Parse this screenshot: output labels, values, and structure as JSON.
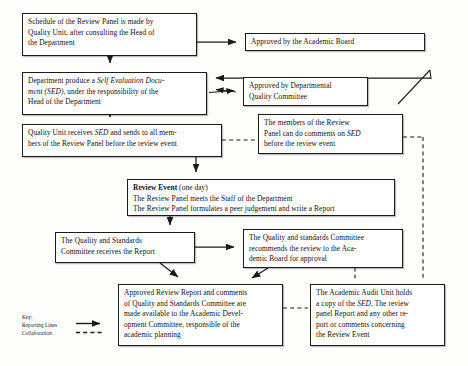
{
  "diagram": {
    "nodes": {
      "schedule": {
        "l1": "Schedule of the Review Panel is made by",
        "l2": "Quality Unit, after consulting the Head of",
        "l3": "the Department"
      },
      "academic_board": {
        "l1": "Approved by the Academic Board"
      },
      "department": {
        "l1a": "Department produce a ",
        "l1b": "Self Evaluation Docu-",
        "l2a": "ment (SED)",
        "l2b": ", under the responsibility of the",
        "l3": "Head of the Department"
      },
      "dept_quality_committee": {
        "l1": "Approved by Departmental",
        "l2": "Quality Committee"
      },
      "review_members": {
        "l1": "The members of the Review",
        "l2a": "Panel can do comments on ",
        "l2b": "SED",
        "l3": "before the review event"
      },
      "quality_unit": {
        "l1a": "Quality Unit receives ",
        "l1b": "SED",
        "l1c": " and sends to all mem-",
        "l2": "bers of the Review Panel before the review event"
      },
      "review_event": {
        "l1a": "Review Event",
        "l1b": " (one day)",
        "l2": "The Review Panel meets the Staff of the Department",
        "l3": "The Review Panel formulates a peer judgement and write a Report"
      },
      "quality_standards_committee": {
        "l1": "The   Quality   and   Standards",
        "l2": "Committee receives the Report"
      },
      "qsc_recommends": {
        "l1": "The Quality and standards Committee",
        "l2": "recommends  the  review  to  the  Aca-",
        "l3": "demic Board for approval"
      },
      "approved_review_report": {
        "l1": "Approved Review Report and comments",
        "l2": "of Quality and Standards Committee are",
        "l3": "made  available  to  the  Academic  Devel-",
        "l4": "opment  Committee,  responsible  of  the",
        "l5": "academic planning"
      },
      "academic_audit_unit": {
        "l1": "The Academic Audit Unit holds",
        "l2a": "a copy of the ",
        "l2b": "SED",
        "l2c": ", The review",
        "l3": "panel Report and any other re-",
        "l4": "port  or  comments  concerning",
        "l5": "the Review Event"
      }
    },
    "legend": {
      "title": "Key:",
      "reporting_lines": "Reporting Lines",
      "collaboration": "Collaboration"
    },
    "colors": {
      "line": "#1b1b1b",
      "box_fill": "#ffffff",
      "text": "#101010",
      "page_background": "#fdfdfb"
    }
  }
}
